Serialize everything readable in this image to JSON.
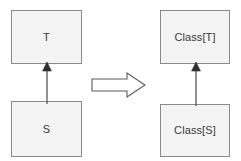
{
  "diagram": {
    "canvas": {
      "width": 241,
      "height": 161,
      "background": "#ffffff"
    },
    "style": {
      "box_fill": "#f4f4f4",
      "box_border": "#8a8a8a",
      "text_color": "#3a3a3a",
      "edge_color": "#4a4a4a",
      "arrow_outline": "#5a5a5a",
      "arrow_fill": "#ffffff"
    },
    "left_group": {
      "name": "before",
      "nodes": [
        {
          "id": "t",
          "label": "T",
          "role": "supertype"
        },
        {
          "id": "s",
          "label": "S",
          "role": "subtype"
        }
      ],
      "edges": [
        {
          "from": "s",
          "to": "t",
          "kind": "generalization",
          "arrowhead": "solid-triangle",
          "direction": "up"
        }
      ]
    },
    "right_group": {
      "name": "after",
      "nodes": [
        {
          "id": "class-t",
          "label": "Class[T]",
          "role": "supertype"
        },
        {
          "id": "class-s",
          "label": "Class[S]",
          "role": "subtype"
        }
      ],
      "edges": [
        {
          "from": "class-s",
          "to": "class-t",
          "kind": "generalization",
          "arrowhead": "solid-triangle",
          "direction": "up"
        }
      ]
    },
    "transform": {
      "icon": "block-arrow-right-icon",
      "label": "implies",
      "glyph": "⇒"
    }
  }
}
